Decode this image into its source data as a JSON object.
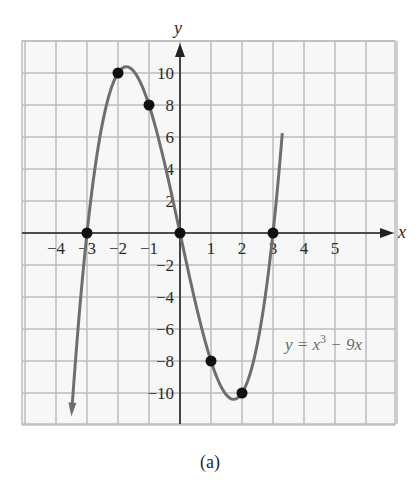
{
  "chart_data": {
    "type": "line",
    "title": "",
    "caption": "(a)",
    "xlabel": "x",
    "ylabel": "y",
    "equation_label": "y = x³ − 9x",
    "function": "x^3 - 9x",
    "xlim": [
      -5,
      7
    ],
    "ylim": [
      -12,
      12
    ],
    "grid": true,
    "x_ticks": [
      -4,
      -3,
      -2,
      -1,
      1,
      2,
      3,
      4,
      5
    ],
    "x_tick_labels": [
      "−4",
      "−3",
      "−2",
      "−1",
      "1",
      "2",
      "3",
      "4",
      "5"
    ],
    "y_ticks": [
      10,
      8,
      6,
      4,
      2,
      -2,
      -4,
      -6,
      -8,
      -10
    ],
    "y_tick_labels": [
      "10",
      "8",
      "6",
      "4",
      "2",
      "−2",
      "−4",
      "−6",
      "−8",
      "−10"
    ],
    "points": [
      {
        "x": -3,
        "y": 0
      },
      {
        "x": -2,
        "y": 10
      },
      {
        "x": -1,
        "y": 8
      },
      {
        "x": 0,
        "y": 0
      },
      {
        "x": 1,
        "y": -8
      },
      {
        "x": 2,
        "y": -10
      },
      {
        "x": 3,
        "y": 0
      }
    ],
    "curve_range": [
      -3.49,
      3.3
    ],
    "colors": {
      "curve": "#6e6e6e",
      "grid": "#bdbdbd",
      "axis": "#222222",
      "points": "#111111",
      "background": "#f7f7f7"
    }
  },
  "labels": {
    "x_axis": "x",
    "y_axis": "y",
    "equation": "y = x³ − 9x",
    "caption": "(a)"
  }
}
